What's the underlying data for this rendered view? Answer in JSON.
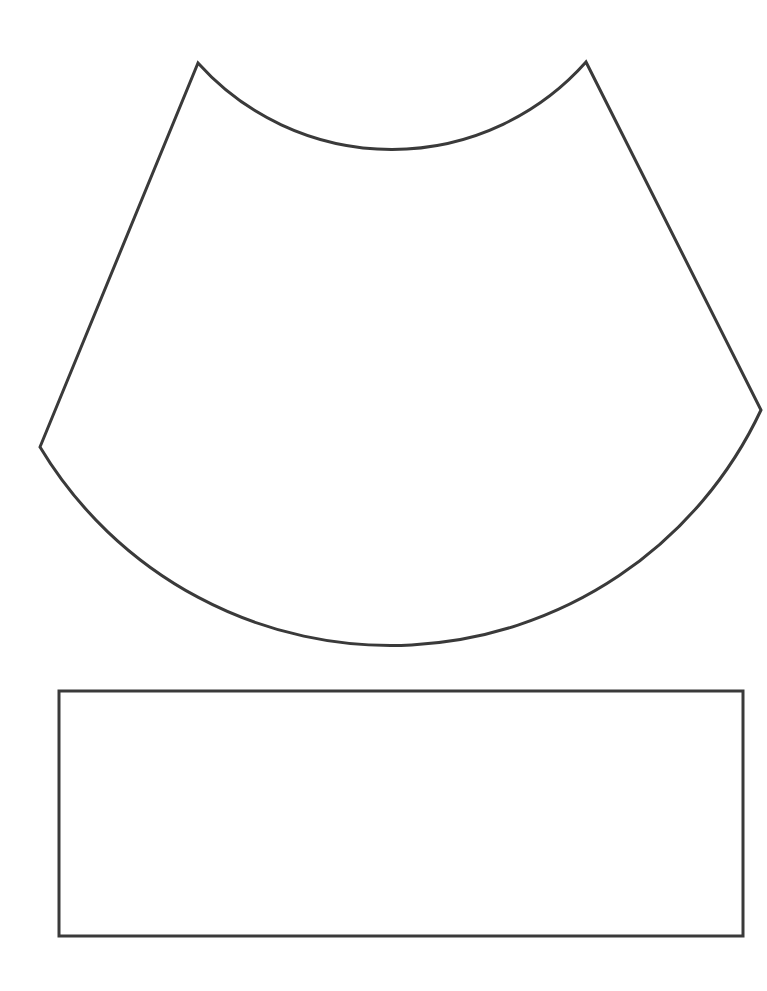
{
  "page": {
    "title": "Cone and rectangle cut-out template",
    "background": "#ffffff",
    "stroke_color": "#3a3a3a",
    "stroke_width": 3
  },
  "shapes": {
    "cone_segment": {
      "label": "Annular sector (cone net)",
      "top_left": [
        198,
        63
      ],
      "top_right": [
        586,
        62
      ],
      "left": [
        40,
        447
      ],
      "right": [
        761,
        410
      ],
      "inner_arc_radius": 260,
      "outer_arc_radius": 409
    },
    "rectangle": {
      "label": "Rectangle strip",
      "x": 59,
      "y": 691,
      "width": 684,
      "height": 245
    }
  }
}
